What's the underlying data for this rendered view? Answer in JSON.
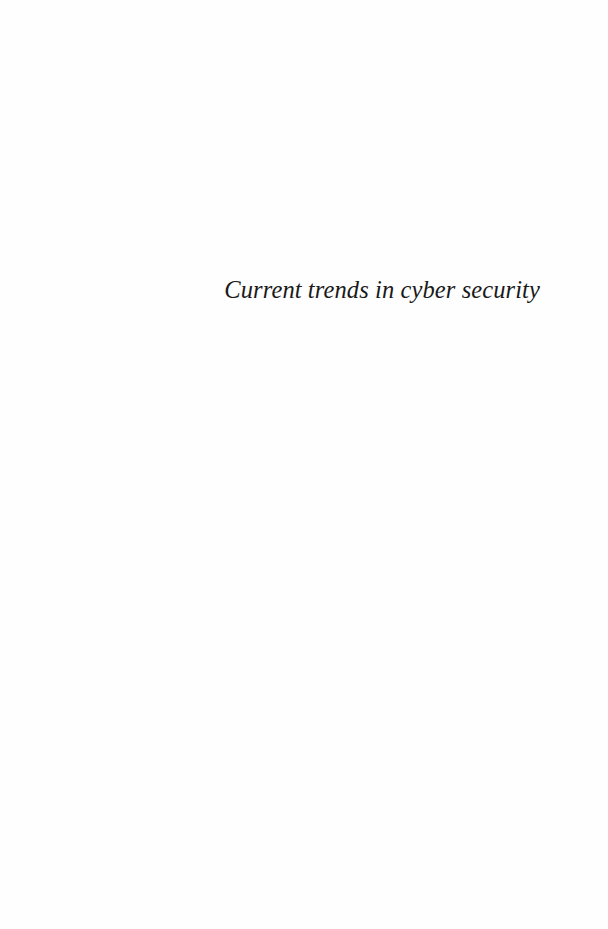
{
  "page": {
    "type": "half-title",
    "title": "Current trends in cyber security",
    "text_color": "#1a1a1a",
    "background_color": "#fefefe"
  }
}
